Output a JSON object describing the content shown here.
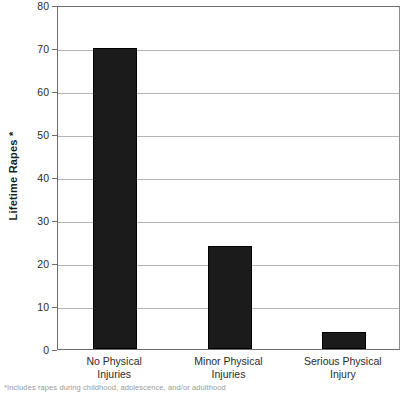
{
  "chart_data": {
    "type": "bar",
    "title": "",
    "xlabel": "",
    "ylabel": "Lifetime Rapes *",
    "categories": [
      "No Physical Injuries",
      "Minor Physical Injuries",
      "Serious Physical Injury"
    ],
    "category_lines": [
      [
        "No Physical",
        "Injuries"
      ],
      [
        "Minor Physical",
        "Injuries"
      ],
      [
        "Serious Physical",
        "Injury"
      ]
    ],
    "values": [
      70,
      24,
      4
    ],
    "ylim": [
      0,
      80
    ],
    "yticks": [
      "0",
      "10",
      "20",
      "30",
      "40",
      "50",
      "60",
      "70",
      "80"
    ],
    "ytick_values": [
      0,
      10,
      20,
      30,
      40,
      50,
      60,
      70,
      80
    ],
    "grid": true,
    "grid_axis": "y",
    "legend": "none",
    "bar_color": "#1b1b1b",
    "grid_color": "#b4b4b4",
    "axis_color": "#6d6d6d",
    "text_color": "#2b2b2b"
  },
  "footnote": {
    "text": "*Includes rapes during childhood, adolescence, and/or adulthood"
  }
}
